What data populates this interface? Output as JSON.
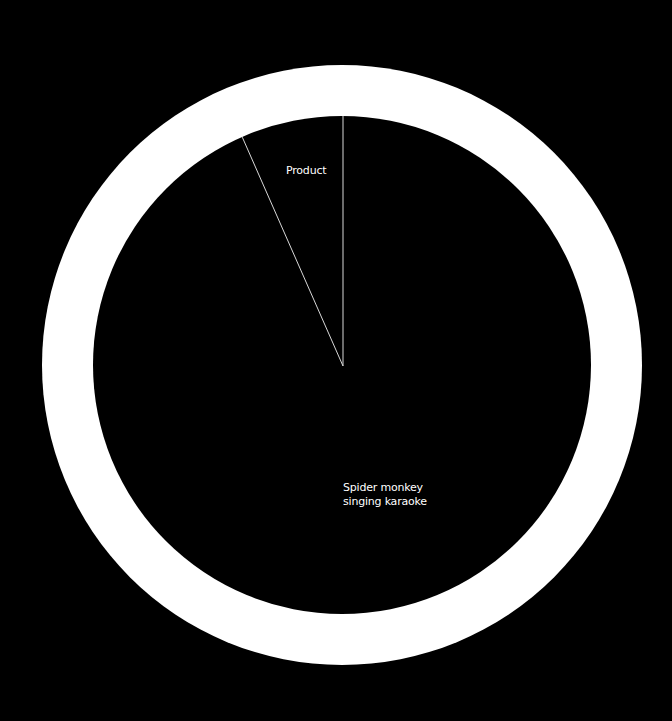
{
  "chart_data": {
    "type": "pie",
    "title": "",
    "categories": [
      "Product",
      "Spider monkey singing karaoke"
    ],
    "values": [
      6.6,
      93.4
    ],
    "unit": "%",
    "legend": "none (inline slice labels)",
    "colors": {
      "background": "#000000",
      "slice_fill": "#000000",
      "ring": "#ffffff",
      "divider": "#d8d8d8",
      "label": "#ffffff"
    },
    "annotations": [
      {
        "text": "Product",
        "slice": "Product"
      },
      {
        "text": "Spider monkey\nsinging karaoke",
        "slice": "Spider monkey singing karaoke"
      }
    ]
  },
  "labels": {
    "product": "Product",
    "spider_monkey": "Spider monkey\nsinging karaoke"
  }
}
